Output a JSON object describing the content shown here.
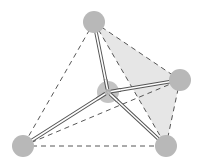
{
  "diagram": {
    "type": "tetrahedral-molecule",
    "colors": {
      "background": "#ffffff",
      "atom_fill": "#b8b8b8",
      "shaded_face": "#e6e6e6",
      "edge_dash": "#444444",
      "bond_outline": "#555555",
      "bond_inner": "#ffffff"
    },
    "atoms": [
      {
        "id": "top",
        "x": 94,
        "y": 22,
        "r": 11
      },
      {
        "id": "center",
        "x": 108,
        "y": 92,
        "r": 11
      },
      {
        "id": "right",
        "x": 180,
        "y": 80,
        "r": 11
      },
      {
        "id": "bottom-left",
        "x": 23,
        "y": 146,
        "r": 11
      },
      {
        "id": "bottom-right",
        "x": 166,
        "y": 146,
        "r": 11
      }
    ],
    "shaded_face": [
      "top",
      "right",
      "bottom-right"
    ],
    "dashed_edges": [
      [
        "top",
        "bottom-left"
      ],
      [
        "top",
        "right"
      ],
      [
        "top",
        "bottom-right"
      ],
      [
        "bottom-left",
        "bottom-right"
      ],
      [
        "bottom-left",
        "right"
      ],
      [
        "right",
        "bottom-right"
      ]
    ],
    "bonds": [
      [
        "center",
        "top"
      ],
      [
        "center",
        "right"
      ],
      [
        "center",
        "bottom-left"
      ],
      [
        "center",
        "bottom-right"
      ]
    ]
  }
}
